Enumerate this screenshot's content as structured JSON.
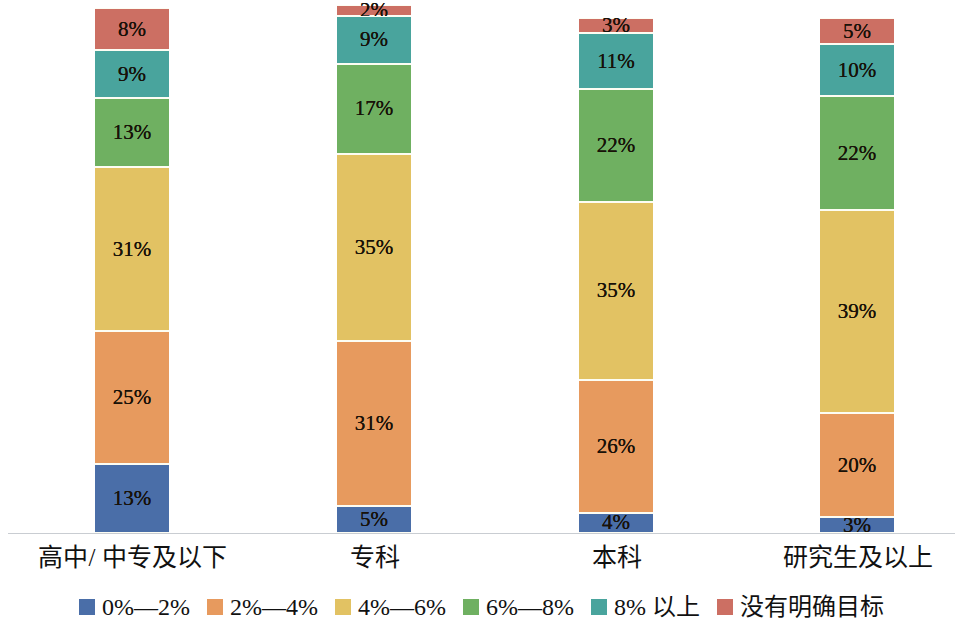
{
  "chart_data": {
    "type": "bar",
    "subtype": "100% stacked column",
    "title": "",
    "subtitle": "",
    "xlabel": "",
    "ylabel": "",
    "ylim": [
      0,
      100
    ],
    "grid": false,
    "legend_position": "bottom",
    "categories": [
      "高中/ 中专及以下",
      "专科",
      "本科",
      "研究生及以上"
    ],
    "series": [
      {
        "name": "0%—2%",
        "color": "#4a6ea8",
        "values": [
          13,
          5,
          4,
          3
        ],
        "labels": [
          "13%",
          "5%",
          "4%",
          "3%"
        ]
      },
      {
        "name": "2%—4%",
        "color": "#e79a5e",
        "values": [
          25,
          31,
          26,
          20
        ],
        "labels": [
          "25%",
          "31%",
          "26%",
          "20%"
        ]
      },
      {
        "name": "4%—6%",
        "color": "#e2c263",
        "values": [
          31,
          35,
          35,
          39
        ],
        "labels": [
          "31%",
          "35%",
          "35%",
          "39%"
        ]
      },
      {
        "name": "6%—8%",
        "color": "#6fb061",
        "values": [
          13,
          17,
          22,
          22
        ],
        "labels": [
          "13%",
          "17%",
          "22%",
          "22%"
        ]
      },
      {
        "name": "8% 以上",
        "color": "#49a49d",
        "values": [
          9,
          9,
          11,
          10
        ],
        "labels": [
          "9%",
          "9%",
          "11%",
          "10%"
        ]
      },
      {
        "name": "没有明确目标",
        "color": "#cc6f63",
        "values": [
          8,
          2,
          3,
          5
        ],
        "labels": [
          "8%",
          "2%",
          "3%",
          "5%"
        ]
      }
    ]
  },
  "legend": {
    "items": [
      {
        "label": "0%—2%",
        "color": "#4a6ea8"
      },
      {
        "label": "2%—4%",
        "color": "#e79a5e"
      },
      {
        "label": "4%—6%",
        "color": "#e2c263"
      },
      {
        "label": "6%—8%",
        "color": "#6fb061"
      },
      {
        "label": "8% 以上",
        "color": "#49a49d"
      },
      {
        "label": "没有明确目标",
        "color": "#cc6f63"
      }
    ]
  },
  "axis": {
    "baseline_color": "#c9cdd2"
  },
  "layout": {
    "bars": [
      {
        "category": "高中/ 中专及以下",
        "left": 95,
        "width": 74,
        "top": 8,
        "bottom": 533,
        "label_left": 10,
        "label_width": 245
      },
      {
        "category": "专科",
        "left": 337,
        "width": 74,
        "top": 5,
        "bottom": 533,
        "label_left": 287,
        "label_width": 175
      },
      {
        "category": "本科",
        "left": 579,
        "width": 74,
        "top": 18,
        "bottom": 533,
        "label_left": 529,
        "label_width": 175
      },
      {
        "category": "研究生及以上",
        "left": 820,
        "width": 74,
        "top": 18,
        "bottom": 533,
        "label_left": 743,
        "label_width": 229
      }
    ]
  }
}
